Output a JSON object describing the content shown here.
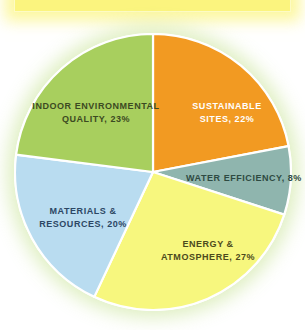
{
  "header": {
    "title": "LEED - NC CREDIT DISTRIBUTION"
  },
  "chart_data": {
    "type": "pie",
    "title": "LEED - NC CREDIT DISTRIBUTION",
    "xlabel": "",
    "ylabel": "",
    "legend_position": "none",
    "grid": false,
    "labels_on_slices": true,
    "categories": [
      "Sustainable Sites",
      "Water Efficiency",
      "Energy & Atmosphere",
      "Materials & Resources",
      "Indoor Environmental Quality"
    ],
    "values": [
      22,
      8,
      27,
      20,
      23
    ],
    "colors": [
      "#f29a22",
      "#8fb5ae",
      "#f7f77e",
      "#b9dcf0",
      "#a8cf5e"
    ],
    "start_angle_deg": 0,
    "direction": "clockwise",
    "slices": [
      {
        "name": "Sustainable Sites",
        "value": 22,
        "color": "#f29a22",
        "label_line1": "Sustainable",
        "label_line2": "Sites, 22%",
        "label_color": "#ffffff"
      },
      {
        "name": "Water Efficiency",
        "value": 8,
        "color": "#8fb5ae",
        "label_line1": "Water Efficiency, 8%",
        "label_line2": "",
        "label_color": "#2e4a42"
      },
      {
        "name": "Energy & Atmosphere",
        "value": 27,
        "color": "#f7f77e",
        "label_line1": "Energy &",
        "label_line2": "Atmosphere, 27%",
        "label_color": "#4c4a1c"
      },
      {
        "name": "Materials & Resources",
        "value": 20,
        "color": "#b9dcf0",
        "label_line1": "Materials &",
        "label_line2": "Resources, 20%",
        "label_color": "#2c4764"
      },
      {
        "name": "Indoor Environmental Quality",
        "value": 23,
        "color": "#a8cf5e",
        "label_line1": "Indoor Environmental",
        "label_line2": "Quality, 23%",
        "label_color": "#3c4a22"
      }
    ]
  },
  "style": {
    "banner_background": "#fbf47e",
    "banner_border": "#fdfbc4",
    "page_background": "#ffffff",
    "slice_divider": "#ffffff"
  }
}
